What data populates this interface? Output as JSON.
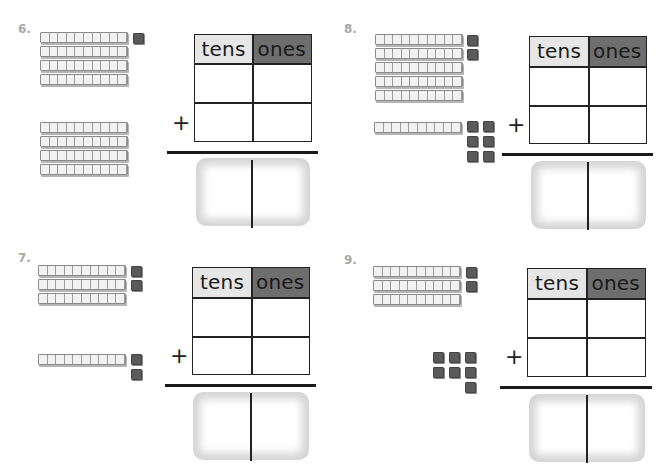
{
  "worksheet": {
    "header_tens": "tens",
    "header_ones": "ones",
    "plus_sign": "+",
    "colors": {
      "tens_header_bg": "#e6e6e6",
      "ones_header_bg": "#6e6e6e",
      "number_label": "#a8a8a8",
      "unit_cube": "#5a5a5a"
    },
    "problems": [
      {
        "number": "6.",
        "addend1": {
          "tens_rods": 4,
          "ones_cubes": 1
        },
        "addend2": {
          "tens_rods": 4,
          "ones_cubes": 0
        },
        "answer_tens": "",
        "answer_ones": ""
      },
      {
        "number": "7.",
        "addend1": {
          "tens_rods": 3,
          "ones_cubes": 2
        },
        "addend2": {
          "tens_rods": 1,
          "ones_cubes": 2
        },
        "answer_tens": "",
        "answer_ones": ""
      },
      {
        "number": "8.",
        "addend1": {
          "tens_rods": 5,
          "ones_cubes": 2
        },
        "addend2": {
          "tens_rods": 1,
          "ones_cubes": 6
        },
        "answer_tens": "",
        "answer_ones": ""
      },
      {
        "number": "9.",
        "addend1": {
          "tens_rods": 3,
          "ones_cubes": 2
        },
        "addend2": {
          "tens_rods": 0,
          "ones_cubes": 7
        },
        "answer_tens": "",
        "answer_ones": ""
      }
    ]
  }
}
